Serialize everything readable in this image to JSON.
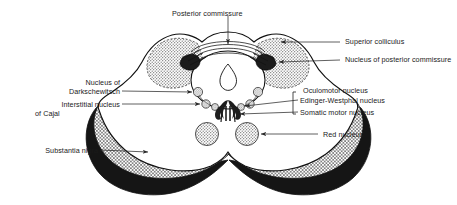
{
  "figure": {
    "colors": {
      "outline": "#111111",
      "substantia_nigra_fill": "#151515",
      "peduncle_crosshatch": "#9a9a9a",
      "colliculus_stipple": "#b9b9b9",
      "nucleus_stipple": "#bdbdbd",
      "leader_line": "#2b2b2b",
      "background": "#ffffff",
      "text": "#1a1a1a"
    }
  },
  "labels": {
    "posterior_commissure": "Posterior commissure",
    "superior_colliculus": "Superior colliculus",
    "nucleus_of_posterior_commissure": "Nucleus of posterior commissure",
    "nucleus_of_darkschewitsch_l1": "Nucleus of",
    "nucleus_of_darkschewitsch_l2": "Darkschewitsch",
    "interstitial_nucleus_of_cajal_l1": "Interstitial nucleus",
    "interstitial_nucleus_of_cajal_l2": "of Cajal",
    "oculomotor_nucleus": "Oculomotor nucleus",
    "edinger_westphal_nucleus": "Edinger-Westphal nucleus",
    "somatic_motor_nucleus": "Somatic motor nucleus",
    "red_nucleus": "Red nucleus",
    "substantia_nigra": "Substantia nigra"
  },
  "structures": [
    {
      "name": "posterior-commissure",
      "side": "midline-dorsal",
      "callout": "top"
    },
    {
      "name": "superior-colliculus",
      "side": "bilateral",
      "fill": "stipple"
    },
    {
      "name": "nucleus-of-posterior-commissure",
      "side": "bilateral",
      "fill": "dark"
    },
    {
      "name": "cerebral-aqueduct",
      "side": "midline",
      "fill": "none"
    },
    {
      "name": "nucleus-of-darkschewitsch",
      "side": "bilateral",
      "fill": "stipple"
    },
    {
      "name": "interstitial-nucleus-of-cajal",
      "side": "bilateral",
      "fill": "stipple"
    },
    {
      "name": "edinger-westphal-nucleus",
      "side": "bilateral",
      "fill": "stipple"
    },
    {
      "name": "somatic-motor-nucleus",
      "side": "midline",
      "fill": "dark"
    },
    {
      "name": "red-nucleus",
      "side": "bilateral",
      "fill": "stipple"
    },
    {
      "name": "substantia-nigra",
      "side": "bilateral",
      "fill": "black"
    },
    {
      "name": "cerebral-peduncle",
      "side": "bilateral",
      "fill": "crosshatch"
    }
  ]
}
